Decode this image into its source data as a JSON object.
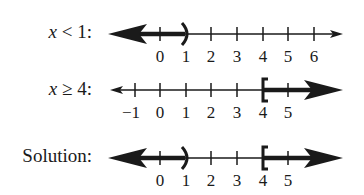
{
  "lines": [
    {
      "label_var": "x",
      "label_rest": " < 1:",
      "inequality": "x < 1",
      "ticks": [
        0,
        1,
        2,
        3,
        4,
        5,
        6
      ],
      "shaded": {
        "from": "-inf",
        "to": 1,
        "endpoint": "open",
        "symbol": ")"
      }
    },
    {
      "label_var": "x",
      "label_rest": " ≥ 4:",
      "inequality": "x ≥ 4",
      "ticks": [
        -1,
        0,
        1,
        2,
        3,
        4,
        5
      ],
      "shaded": {
        "from": 4,
        "to": "inf",
        "endpoint": "closed",
        "symbol": "["
      }
    },
    {
      "label_var": "",
      "label_rest": "Solution:",
      "inequality": "x < 1 or x ≥ 4",
      "ticks": [
        0,
        1,
        2,
        3,
        4,
        5
      ],
      "shaded": [
        {
          "from": "-inf",
          "to": 1,
          "endpoint": "open",
          "symbol": ")"
        },
        {
          "from": 4,
          "to": "inf",
          "endpoint": "closed",
          "symbol": "["
        }
      ]
    }
  ],
  "tick_labels": {
    "line1": [
      "0",
      "1",
      "2",
      "3",
      "4",
      "5",
      "6"
    ],
    "line2": [
      "−1",
      "0",
      "1",
      "2",
      "3",
      "4",
      "5"
    ],
    "line3": [
      "0",
      "1",
      "2",
      "3",
      "4",
      "5"
    ]
  },
  "colors": {
    "ink": "#1a1a1a",
    "background": "#ffffff"
  }
}
